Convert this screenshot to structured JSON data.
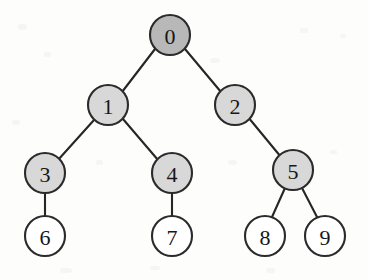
{
  "figure": {
    "name": "binary-tree-diagram",
    "background_color": "#fdfdfc",
    "stroke_color": "#2b2b2b",
    "edge_color": "#262626",
    "filled_node_color": "#d8d8d8",
    "root_node_color": "#b8b8b8",
    "empty_node_color": "#ffffff",
    "label_color": "#171717",
    "node_radius": 20
  },
  "nodes": [
    {
      "id": "n0",
      "label": "0",
      "cx": 170,
      "cy": 35,
      "fill": "#b8b8b8",
      "level": 0,
      "style": "root-shaded"
    },
    {
      "id": "n1",
      "label": "1",
      "cx": 108,
      "cy": 105,
      "fill": "#d8d8d8",
      "level": 1,
      "style": "shaded"
    },
    {
      "id": "n2",
      "label": "2",
      "cx": 235,
      "cy": 105,
      "fill": "#d8d8d8",
      "level": 1,
      "style": "shaded"
    },
    {
      "id": "n3",
      "label": "3",
      "cx": 45,
      "cy": 173,
      "fill": "#d8d8d8",
      "level": 2,
      "style": "shaded"
    },
    {
      "id": "n4",
      "label": "4",
      "cx": 172,
      "cy": 173,
      "fill": "#d8d8d8",
      "level": 2,
      "style": "shaded"
    },
    {
      "id": "n5",
      "label": "5",
      "cx": 293,
      "cy": 170,
      "fill": "#d8d8d8",
      "level": 2,
      "style": "shaded"
    },
    {
      "id": "n6",
      "label": "6",
      "cx": 45,
      "cy": 236,
      "fill": "#ffffff",
      "level": 3,
      "style": "empty"
    },
    {
      "id": "n7",
      "label": "7",
      "cx": 172,
      "cy": 236,
      "fill": "#ffffff",
      "level": 3,
      "style": "empty"
    },
    {
      "id": "n8",
      "label": "8",
      "cx": 265,
      "cy": 236,
      "fill": "#ffffff",
      "level": 3,
      "style": "empty"
    },
    {
      "id": "n9",
      "label": "9",
      "cx": 325,
      "cy": 236,
      "fill": "#ffffff",
      "level": 3,
      "style": "empty"
    }
  ],
  "edges": [
    {
      "id": "e0-1",
      "from": "n0",
      "to": "n1",
      "x1": 155,
      "y1": 49,
      "x2": 122,
      "y2": 92
    },
    {
      "id": "e0-2",
      "from": "n0",
      "to": "n2",
      "x1": 185,
      "y1": 49,
      "x2": 221,
      "y2": 92
    },
    {
      "id": "e1-3",
      "from": "n1",
      "to": "n3",
      "x1": 94,
      "y1": 120,
      "x2": 58,
      "y2": 160
    },
    {
      "id": "e1-4",
      "from": "n1",
      "to": "n4",
      "x1": 123,
      "y1": 119,
      "x2": 158,
      "y2": 160
    },
    {
      "id": "e2-5",
      "from": "n2",
      "to": "n5",
      "x1": 248,
      "y1": 117,
      "x2": 281,
      "y2": 157
    },
    {
      "id": "e3-6",
      "from": "n3",
      "to": "n6",
      "x1": 45,
      "y1": 193,
      "x2": 45,
      "y2": 216
    },
    {
      "id": "e4-7",
      "from": "n4",
      "to": "n7",
      "x1": 172,
      "y1": 193,
      "x2": 172,
      "y2": 216
    },
    {
      "id": "e5-8",
      "from": "n5",
      "to": "n8",
      "x1": 285,
      "y1": 188,
      "x2": 272,
      "y2": 217
    },
    {
      "id": "e5-9",
      "from": "n5",
      "to": "n9",
      "x1": 302,
      "y1": 188,
      "x2": 317,
      "y2": 217
    }
  ]
}
